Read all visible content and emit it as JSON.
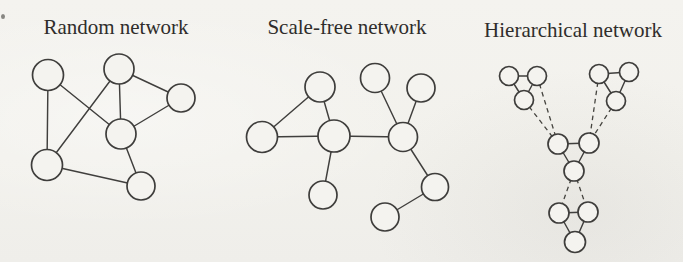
{
  "figure": {
    "kind": "network-comparison-diagram",
    "background_color": "#f3f2ee",
    "line_color": "#3e3d3b",
    "panels": [
      {
        "title": "Random network",
        "nodes": [
          {
            "id": "a",
            "x": 48,
            "y": 75,
            "r": 15.5
          },
          {
            "id": "b",
            "x": 119,
            "y": 69,
            "r": 15
          },
          {
            "id": "c",
            "x": 181,
            "y": 98,
            "r": 14
          },
          {
            "id": "d",
            "x": 121,
            "y": 134,
            "r": 15
          },
          {
            "id": "e",
            "x": 47,
            "y": 165,
            "r": 15.5
          },
          {
            "id": "f",
            "x": 141,
            "y": 186,
            "r": 14
          }
        ],
        "edges": [
          {
            "from": "a",
            "to": "e",
            "dashed": false
          },
          {
            "from": "a",
            "to": "d",
            "dashed": false
          },
          {
            "from": "b",
            "to": "e",
            "dashed": false
          },
          {
            "from": "b",
            "to": "d",
            "dashed": false
          },
          {
            "from": "b",
            "to": "c",
            "dashed": false
          },
          {
            "from": "c",
            "to": "d",
            "dashed": false
          },
          {
            "from": "d",
            "to": "f",
            "dashed": false
          },
          {
            "from": "e",
            "to": "f",
            "dashed": false
          }
        ]
      },
      {
        "title": "Scale-free network",
        "nodes": [
          {
            "id": "t1",
            "x": 320,
            "y": 87,
            "r": 15
          },
          {
            "id": "l",
            "x": 262,
            "y": 137,
            "r": 15.5
          },
          {
            "id": "h",
            "x": 334,
            "y": 136,
            "r": 16
          },
          {
            "id": "t2",
            "x": 375,
            "y": 78,
            "r": 14.5
          },
          {
            "id": "t3",
            "x": 421,
            "y": 88,
            "r": 14
          },
          {
            "id": "r",
            "x": 403,
            "y": 137,
            "r": 14.5
          },
          {
            "id": "bl",
            "x": 323,
            "y": 195,
            "r": 14
          },
          {
            "id": "rl",
            "x": 435,
            "y": 187,
            "r": 13.5
          },
          {
            "id": "bt",
            "x": 385,
            "y": 217,
            "r": 14
          }
        ],
        "edges": [
          {
            "from": "l",
            "to": "t1",
            "dashed": false
          },
          {
            "from": "l",
            "to": "h",
            "dashed": false
          },
          {
            "from": "t1",
            "to": "h",
            "dashed": false
          },
          {
            "from": "h",
            "to": "bl",
            "dashed": false
          },
          {
            "from": "h",
            "to": "r",
            "dashed": false
          },
          {
            "from": "r",
            "to": "t2",
            "dashed": false
          },
          {
            "from": "r",
            "to": "t3",
            "dashed": false
          },
          {
            "from": "r",
            "to": "rl",
            "dashed": false
          },
          {
            "from": "rl",
            "to": "bt",
            "dashed": false
          }
        ]
      },
      {
        "title": "Hierarchical network",
        "nodes": [
          {
            "id": "a1",
            "x": 509,
            "y": 76,
            "r": 9.5
          },
          {
            "id": "a2",
            "x": 537,
            "y": 76,
            "r": 9.5
          },
          {
            "id": "a3",
            "x": 524,
            "y": 100,
            "r": 9.5
          },
          {
            "id": "b1",
            "x": 599,
            "y": 74,
            "r": 9.5
          },
          {
            "id": "b2",
            "x": 629,
            "y": 72,
            "r": 9.5
          },
          {
            "id": "b3",
            "x": 616,
            "y": 101,
            "r": 9.5
          },
          {
            "id": "m1",
            "x": 558,
            "y": 144,
            "r": 10
          },
          {
            "id": "m2",
            "x": 589,
            "y": 143,
            "r": 10
          },
          {
            "id": "m3",
            "x": 574,
            "y": 171,
            "r": 10
          },
          {
            "id": "c1",
            "x": 559,
            "y": 213,
            "r": 10
          },
          {
            "id": "c2",
            "x": 588,
            "y": 212,
            "r": 10
          },
          {
            "id": "c3",
            "x": 575,
            "y": 242,
            "r": 10.5
          }
        ],
        "edges": [
          {
            "from": "a1",
            "to": "a2",
            "dashed": false
          },
          {
            "from": "a1",
            "to": "a3",
            "dashed": false
          },
          {
            "from": "a2",
            "to": "a3",
            "dashed": false
          },
          {
            "from": "b1",
            "to": "b2",
            "dashed": false
          },
          {
            "from": "b1",
            "to": "b3",
            "dashed": false
          },
          {
            "from": "b2",
            "to": "b3",
            "dashed": false
          },
          {
            "from": "m1",
            "to": "m2",
            "dashed": false
          },
          {
            "from": "m1",
            "to": "m3",
            "dashed": false
          },
          {
            "from": "m2",
            "to": "m3",
            "dashed": false
          },
          {
            "from": "c1",
            "to": "c2",
            "dashed": false
          },
          {
            "from": "c1",
            "to": "c3",
            "dashed": false
          },
          {
            "from": "c2",
            "to": "c3",
            "dashed": false
          },
          {
            "from": "a3",
            "to": "m1",
            "dashed": true
          },
          {
            "from": "a2",
            "to": "m1",
            "dashed": true
          },
          {
            "from": "b1",
            "to": "m2",
            "dashed": true
          },
          {
            "from": "b3",
            "to": "m2",
            "dashed": true
          },
          {
            "from": "m3",
            "to": "c1",
            "dashed": true
          },
          {
            "from": "m3",
            "to": "c2",
            "dashed": true
          }
        ]
      }
    ]
  }
}
